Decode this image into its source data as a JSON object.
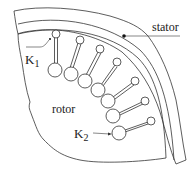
{
  "diagram": {
    "type": "motor-cross-section",
    "labels": {
      "stator": "stator",
      "rotor": "rotor",
      "k1_main": "K",
      "k1_sub": "1",
      "k2_main": "K",
      "k2_sub": "2"
    },
    "stroke_color": "#333333",
    "background": "#ffffff",
    "rotor_bars": [
      {
        "id": 1,
        "top": [
          56,
          34
        ],
        "bottom": [
          55,
          70
        ],
        "r_top": 4,
        "r_bottom": 7
      },
      {
        "id": 2,
        "top": [
          80,
          40
        ],
        "bottom": [
          71,
          74
        ],
        "r_top": 4,
        "r_bottom": 7
      },
      {
        "id": 3,
        "top": [
          100,
          49
        ],
        "bottom": [
          85,
          81
        ],
        "r_top": 4,
        "r_bottom": 7
      },
      {
        "id": 4,
        "top": [
          117,
          62
        ],
        "bottom": [
          98,
          90
        ],
        "r_top": 4,
        "r_bottom": 7
      },
      {
        "id": 5,
        "top": [
          135,
          81
        ],
        "bottom": [
          108,
          101
        ],
        "r_top": 4,
        "r_bottom": 7
      },
      {
        "id": 6,
        "top": [
          145,
          101
        ],
        "bottom": [
          113,
          116
        ],
        "r_top": 4,
        "r_bottom": 7
      },
      {
        "id": 7,
        "top": [
          151,
          121
        ],
        "bottom": [
          119,
          133
        ],
        "r_top": 4,
        "r_bottom": 7
      }
    ]
  }
}
